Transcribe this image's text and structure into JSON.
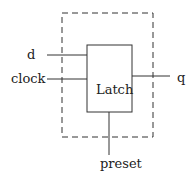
{
  "diagram": {
    "block_label": "Latch",
    "inputs": [
      {
        "label": "d"
      },
      {
        "label": "clock"
      }
    ],
    "output": {
      "label": "q"
    },
    "bottom_input": {
      "label": "preset"
    },
    "colors": {
      "stroke": "#333333",
      "text": "#222222",
      "background": "#ffffff"
    }
  }
}
